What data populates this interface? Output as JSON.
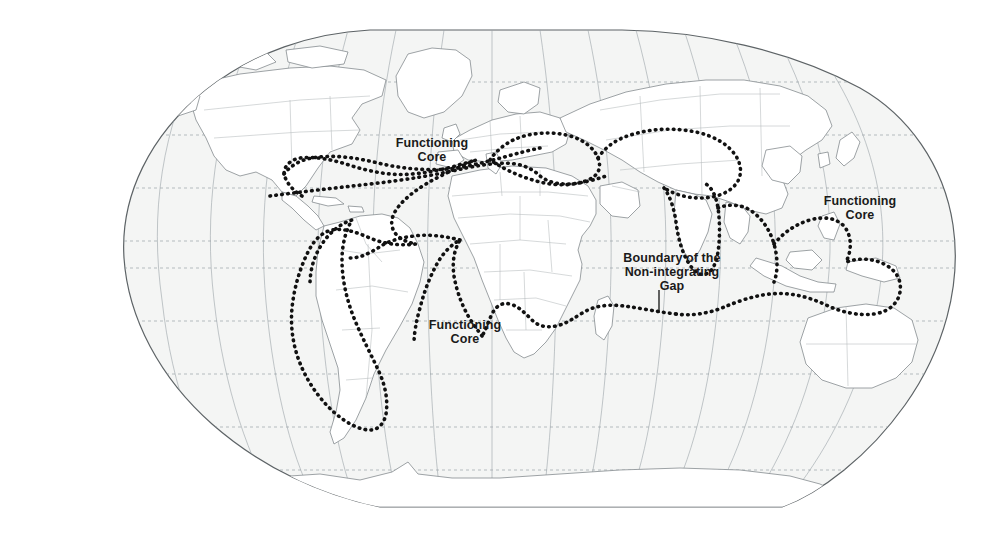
{
  "figure": {
    "kind": "world-map",
    "projection": "robinson-style pseudocylindrical"
  },
  "colors": {
    "page_background": "#ffffff",
    "ocean_fill": "#f4f5f4",
    "land_fill": "#ffffff",
    "graticule": "#9aa3a8",
    "coastline": "#7d8488",
    "country_border": "#b3b9bc",
    "map_frame": "#5d6366",
    "gap_boundary": "#111111",
    "label_text": "#1a1a1a",
    "leader_line": "#111111"
  },
  "labels": {
    "core_north_america": "Functioning\nCore",
    "core_south_atlantic": "Functioning\nCore",
    "core_australasia": "Functioning\nCore",
    "gap_boundary": "Boundary of the\nNon-integrating\nGap"
  },
  "legend_terms": [
    "Functioning Core",
    "Non-integrating Gap"
  ],
  "graticule": {
    "parallel_interval_degrees": 15,
    "meridian_interval_degrees": 15,
    "parallels_style": "dashed",
    "meridians_style": "solid-thin",
    "grid": true
  },
  "map_extent": {
    "left_px": 47,
    "right_px": 955,
    "top_px": 30,
    "bottom_px": 508
  },
  "gap_regions_enclosed": [
    "Caribbean and Central America",
    "Andean and central South America",
    "Northern and Sub-Saharan Africa",
    "Balkans and Caucasus",
    "Middle East",
    "Central Asia",
    "South Asia",
    "Southeast Asia",
    "Indonesia and New Guinea"
  ],
  "core_regions_outside": [
    "United States and Canada",
    "Western Europe",
    "Southern cone of South America",
    "South Africa",
    "Russia",
    "China",
    "Japan and Korea",
    "Australia and New Zealand"
  ]
}
